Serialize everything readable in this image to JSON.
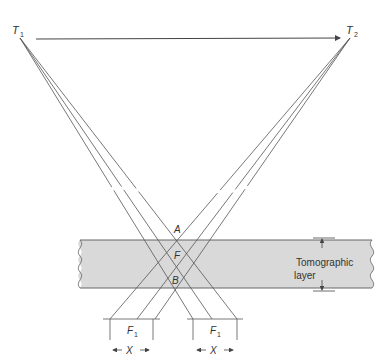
{
  "diagram": {
    "type": "tomography-geometry",
    "tube_start_label": "T",
    "tube_start_sub": "1",
    "tube_end_label": "T",
    "tube_end_sub": "2",
    "points": {
      "a": "A",
      "f": "F",
      "b": "B"
    },
    "layer_label_line1": "Tomographic",
    "layer_label_line2": "layer",
    "film_left_label": "F",
    "film_left_sub": "1",
    "film_right_label": "F",
    "film_right_sub": "1",
    "film_left_shift": "X",
    "film_right_shift": "X",
    "colors": {
      "line": "#555555",
      "band_fill": "#d9d9d9",
      "band_edge": "#666666",
      "text": "#333333"
    }
  }
}
